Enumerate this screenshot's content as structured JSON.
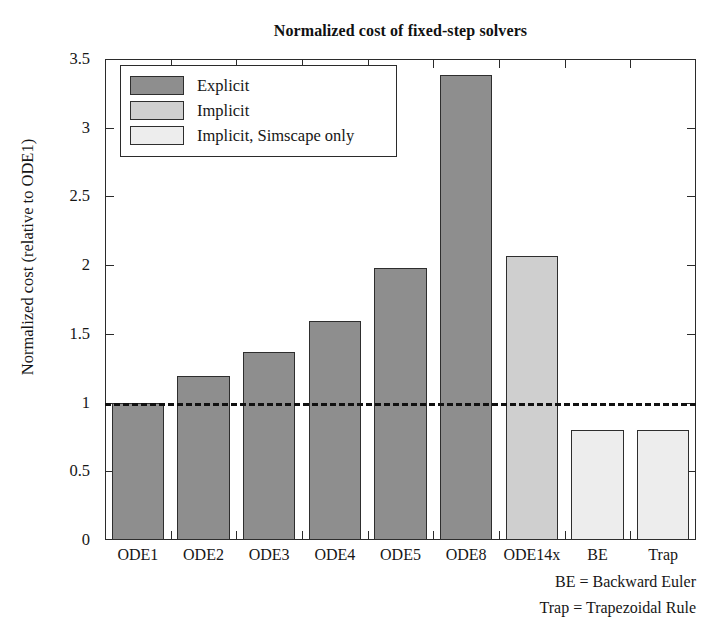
{
  "chart_data": {
    "type": "bar",
    "title": "Normalized cost of fixed-step solvers",
    "xlabel": "",
    "ylabel": "Normalized cost (relative to ODE1)",
    "categories": [
      "ODE1",
      "ODE2",
      "ODE3",
      "ODE4",
      "ODE5",
      "ODE8",
      "ODE14x",
      "BE",
      "Trap"
    ],
    "values": [
      1.0,
      1.19,
      1.37,
      1.59,
      1.98,
      3.38,
      2.07,
      0.8,
      0.8
    ],
    "series_group": [
      "Explicit",
      "Explicit",
      "Explicit",
      "Explicit",
      "Explicit",
      "Explicit",
      "Implicit",
      "Implicit, Simscape only",
      "Implicit, Simscape only"
    ],
    "ylim": [
      0,
      3.5
    ],
    "yticks": [
      "0",
      "0.5",
      "1",
      "1.5",
      "2",
      "2.5",
      "3",
      "3.5"
    ],
    "ytick_values": [
      0,
      0.5,
      1,
      1.5,
      2,
      2.5,
      3,
      3.5
    ],
    "grid": false,
    "legend_position": "upper left",
    "legend": [
      {
        "label": "Explicit",
        "color": "#8e8e8e"
      },
      {
        "label": "Implicit",
        "color": "#cfcfcf"
      },
      {
        "label": "Implicit, Simscape only",
        "color": "#ededed"
      }
    ],
    "reference_line": {
      "value": 1.0,
      "style": "dashed",
      "color": "#111111"
    },
    "annotations": [
      "BE = Backward Euler",
      "Trap = Trapezoidal Rule"
    ]
  },
  "colors": {
    "explicit": "#8e8e8e",
    "implicit": "#cfcfcf",
    "implicit_simscape": "#ededed",
    "axis": "#2b2b2b",
    "background": "#ffffff",
    "text": "#161616"
  }
}
